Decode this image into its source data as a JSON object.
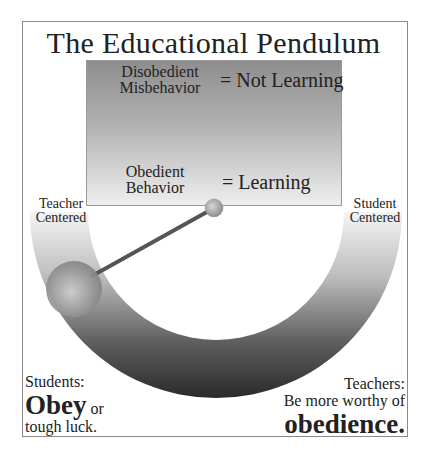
{
  "title": "The Educational Pendulum",
  "box": {
    "top_left_line1": "Disobedient",
    "top_left_line2": "Misbehavior",
    "top_right": "= Not Learning",
    "bottom_left_line1": "Obedient",
    "bottom_left_line2": "Behavior",
    "bottom_right": "= Learning"
  },
  "scale": {
    "left_line1": "Teacher",
    "left_line2": "Centered",
    "right_line1": "Student",
    "right_line2": "Centered"
  },
  "students_note": {
    "line1": "Students:",
    "emphasis": "Obey",
    "after": " or",
    "line3": "tough luck."
  },
  "teachers_note": {
    "line1": "Teachers:",
    "line2": "Be more worthy of",
    "emphasis": "obedience."
  },
  "colors": {
    "arc_light": "#f2f2f2",
    "arc_dark": "#2e2e2e",
    "rod": "#555555",
    "ball": "#9a9a9a"
  }
}
